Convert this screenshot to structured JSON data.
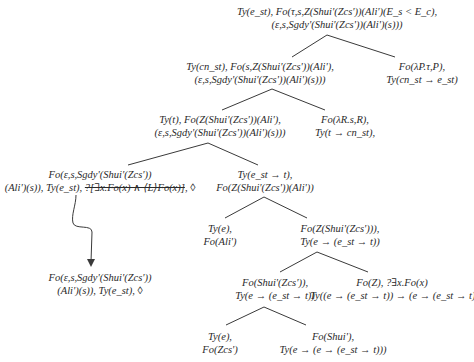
{
  "diagram": {
    "type": "semantic-tree",
    "line_color": "#3a3a3a",
    "nodes": {
      "root": {
        "line1": "Ty(e_st), Fo(τ,s,Z(Shui'(Zcs'))(Ali')(E_s < E_c),",
        "line2": "(ε,s,Sgdy'(Shui'(Zcs'))(Ali')(s)))"
      },
      "n0": {
        "line1": "Ty(cn_st), Fo(s,Z(Shui'(Zcs'))(Ali'),",
        "line2": "(ε,s,Sgdy'(Shui'(Zcs'))(Ali')(s)))"
      },
      "n1": {
        "line1": "Fo(λP.τ,P),",
        "line2": "Ty(cn_st → e_st)"
      },
      "n00": {
        "line1": "Ty(t), Fo(Z(Shui'(Zcs'))(Ali'),",
        "line2": "(ε,s,Sgdy'(Shui'(Zcs'))(Ali')(s)))"
      },
      "n01": {
        "line1": "Fo(λR.s,R),",
        "line2": "Ty(t → cn_st),"
      },
      "n000": {
        "line1": "Fo(ε,s,Sgdy'(Shui'(Zcs'))",
        "line2_prefix": "(Ali')(s)), Ty(e_st), ",
        "line2_struck": "?[∃x.Fo(x) ∧ ⟨L⟩Fo(x)]",
        "line2_suffix": ", ◊"
      },
      "n001": {
        "line1": "Ty(e_st → t),",
        "line2": "Fo(Z(Shui'(Zcs'))(Ali'))"
      },
      "n0010": {
        "line1": "Ty(e),",
        "line2": "Fo(Ali')"
      },
      "n0011": {
        "line1": "Fo(Z(Shui'(Zcs'))),",
        "line2": "Ty(e → (e_st → t))"
      },
      "n00110": {
        "line1": "Fo(Shui'(Zcs')),",
        "line2": "Ty(e → (e_st → t))"
      },
      "n00111": {
        "line1": "Fo(Z), ?∃x.Fo(x)",
        "line2": "Ty((e → (e_st → t)) → (e → (e_st → t)))"
      },
      "n001100": {
        "line1": "Ty(e),",
        "line2": "Fo(Zcs')"
      },
      "n001101": {
        "line1": "Fo(Shui'),",
        "line2": "Ty(e → (e → (e_st → t)))"
      },
      "result": {
        "line1": "Fo(ε,s,Sgdy'(Shui'(Zcs'))",
        "line2": "(Ali')(s)), Ty(e_st), ◊"
      }
    },
    "edges": [
      [
        "root",
        "n0"
      ],
      [
        "root",
        "n1"
      ],
      [
        "n0",
        "n00"
      ],
      [
        "n0",
        "n01"
      ],
      [
        "n00",
        "n000"
      ],
      [
        "n00",
        "n001"
      ],
      [
        "n001",
        "n0010"
      ],
      [
        "n001",
        "n0011"
      ],
      [
        "n0011",
        "n00110"
      ],
      [
        "n0011",
        "n00111"
      ],
      [
        "n00110",
        "n001100"
      ],
      [
        "n00110",
        "n001101"
      ]
    ],
    "arrow": {
      "from": "n000",
      "to": "result",
      "style": "wavy-downward"
    }
  }
}
